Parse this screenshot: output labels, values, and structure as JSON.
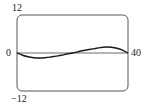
{
  "chart_data": {
    "type": "line",
    "title": "",
    "xlabel": "",
    "ylabel": "",
    "xlim": [
      0,
      40
    ],
    "ylim": [
      -12,
      12
    ],
    "grid": false,
    "legend": null,
    "tick_labels": {
      "y_top": "12",
      "y_bottom": "−12",
      "x_left": "0",
      "x_right": "40"
    },
    "axis_line": {
      "y": 0
    },
    "series": [
      {
        "name": "curve",
        "x": [
          0,
          2,
          4,
          6,
          8,
          10,
          12,
          14,
          16,
          18,
          20,
          22,
          24,
          26,
          28,
          30,
          32,
          34,
          36,
          38,
          40
        ],
        "y": [
          0,
          -0.7,
          -1.2,
          -1.5,
          -1.6,
          -1.5,
          -1.3,
          -1.0,
          -0.7,
          -0.3,
          0,
          0.4,
          0.8,
          1.1,
          1.4,
          1.7,
          1.9,
          1.8,
          1.5,
          0.9,
          0
        ]
      }
    ],
    "colors": {
      "frame": "#555555",
      "curve": "#1a1a1a",
      "axis": "#444444"
    }
  }
}
